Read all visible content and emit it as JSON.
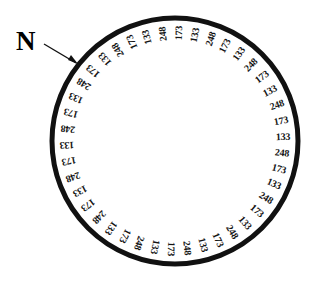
{
  "figure": {
    "background_color": "#ffffff",
    "ink_color": "#111111"
  },
  "north_marker": {
    "label": "N",
    "icon": "arrow-icon",
    "points_to_angle_deg": 315,
    "description": "Bold letter N with a leader arrow pointing at the upper-left of the ring"
  },
  "dial": {
    "center_x": 175,
    "center_y": 141,
    "outer_radius": 123,
    "ring_stroke_width": 5,
    "label_radius": 108,
    "label_count": 42,
    "angular_step_deg": 8.571,
    "start_angle_deg": 315,
    "direction": "clockwise",
    "repeat_cycle": [
      248,
      173,
      133
    ],
    "values": [
      248,
      173,
      133,
      248,
      173,
      133,
      248,
      173,
      133,
      248,
      173,
      133,
      248,
      173,
      133,
      248,
      173,
      133,
      248,
      173,
      133,
      248,
      173,
      133,
      248,
      173,
      133,
      248,
      173,
      133,
      248,
      173,
      133,
      248,
      173,
      133,
      248,
      173,
      133,
      248,
      173,
      133
    ]
  },
  "chart_data": {
    "type": "pie",
    "xlabel": "",
    "ylabel": "",
    "categories": [
      "1",
      "2",
      "3",
      "4",
      "5",
      "6",
      "7",
      "8",
      "9",
      "10",
      "11",
      "12",
      "13",
      "14",
      "15",
      "16",
      "17",
      "18",
      "19",
      "20",
      "21",
      "22",
      "23",
      "24",
      "25",
      "26",
      "27",
      "28",
      "29",
      "30",
      "31",
      "32",
      "33",
      "34",
      "35",
      "36",
      "37",
      "38",
      "39",
      "40",
      "41",
      "42"
    ],
    "values": [
      248,
      173,
      133,
      248,
      173,
      133,
      248,
      173,
      133,
      248,
      173,
      133,
      248,
      173,
      133,
      248,
      173,
      133,
      248,
      173,
      133,
      248,
      173,
      133,
      248,
      173,
      133,
      248,
      173,
      133,
      248,
      173,
      133,
      248,
      173,
      133,
      248,
      173,
      133,
      248,
      173,
      133
    ],
    "legend": [],
    "annotations": [
      "N"
    ],
    "grid": false
  }
}
